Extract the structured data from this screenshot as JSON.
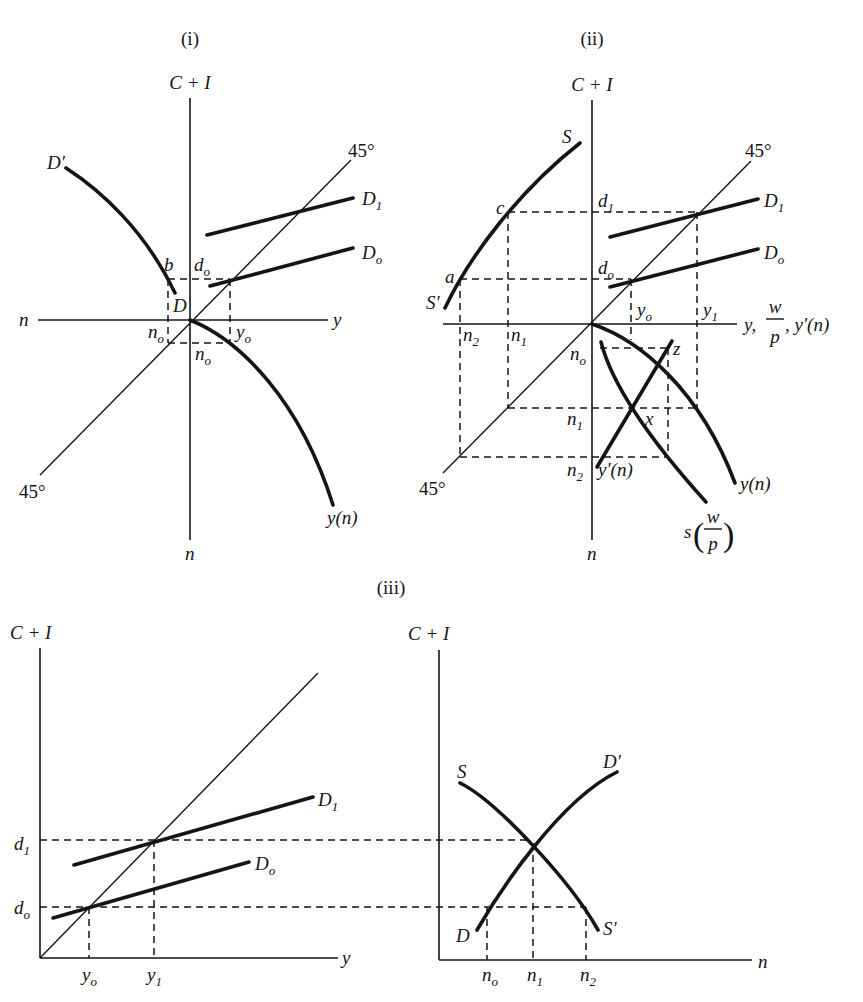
{
  "panels": {
    "i": {
      "title": "(i)",
      "axis_top": "C + I",
      "axis_left": "n",
      "axis_right": "y",
      "axis_bottom": "n",
      "deg45_upper": "45°",
      "deg45_lower": "45°",
      "curve_D_prime": "D′",
      "curve_D1": {
        "main": "D",
        "sub": "1"
      },
      "curve_D0": {
        "main": "D",
        "sub": "o"
      },
      "curve_yn": "y(n)",
      "point_b": "b",
      "point_d0": {
        "main": "d",
        "sub": "o"
      },
      "point_D": "D",
      "tick_n0_left": {
        "main": "n",
        "sub": "o"
      },
      "tick_y0": {
        "main": "y",
        "sub": "o"
      },
      "tick_n0_below": {
        "main": "n",
        "sub": "o"
      }
    },
    "ii": {
      "title": "(ii)",
      "axis_top": "C + I",
      "axis_right": {
        "head": "y,",
        "frac_num": "w",
        "frac_den": "p",
        "tail": ", y′(n)"
      },
      "axis_bottom": "n",
      "deg45_upper": "45°",
      "deg45_lower": "45°",
      "curve_S": "S",
      "curve_S_prime": "S′",
      "curve_D1": {
        "main": "D",
        "sub": "1"
      },
      "curve_D0": {
        "main": "D",
        "sub": "o"
      },
      "curve_yn": "y(n)",
      "curve_y_prime_n": "y′(n)",
      "curve_s_wp": {
        "main": "s",
        "open": "(",
        "num": "w",
        "den": "p",
        "close": ")"
      },
      "point_a": "a",
      "point_c": "c",
      "point_x": "x",
      "point_z": "z",
      "point_d1": {
        "main": "d",
        "sub": "1"
      },
      "point_d0": {
        "main": "d",
        "sub": "o"
      },
      "tick_y0": {
        "main": "y",
        "sub": "o"
      },
      "tick_y1": {
        "main": "y",
        "sub": "1"
      },
      "tick_n2_upper": {
        "main": "n",
        "sub": "2"
      },
      "tick_n1_upper": {
        "main": "n",
        "sub": "1"
      },
      "tick_n0": {
        "main": "n",
        "sub": "o"
      },
      "tick_n1_lower": {
        "main": "n",
        "sub": "1"
      },
      "tick_n2_lower": {
        "main": "n",
        "sub": "2"
      }
    },
    "iii": {
      "title": "(iii)",
      "left": {
        "axis_top": "C + I",
        "axis_right": "y",
        "curve_D1": {
          "main": "D",
          "sub": "1"
        },
        "curve_D0": {
          "main": "D",
          "sub": "o"
        },
        "tick_d1": {
          "main": "d",
          "sub": "1"
        },
        "tick_d0": {
          "main": "d",
          "sub": "o"
        },
        "tick_y0": {
          "main": "y",
          "sub": "o"
        },
        "tick_y1": {
          "main": "y",
          "sub": "1"
        }
      },
      "right": {
        "axis_top": "C + I",
        "axis_right": "n",
        "curve_S": "S",
        "curve_S_prime": "S′",
        "curve_D": "D",
        "curve_D_prime": "D′",
        "tick_n0": {
          "main": "n",
          "sub": "o"
        },
        "tick_n1": {
          "main": "n",
          "sub": "1"
        },
        "tick_n2": {
          "main": "n",
          "sub": "2"
        }
      }
    }
  },
  "style": {
    "ink": "#151515",
    "paper": "#ffffff"
  }
}
